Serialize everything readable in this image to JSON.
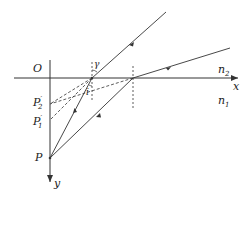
{
  "diagram": {
    "type": "refraction-ray-diagram",
    "labels": {
      "origin": "O",
      "x_axis": "x",
      "y_axis": "y",
      "medium_upper": "n",
      "medium_upper_sub": "2",
      "medium_lower": "n",
      "medium_lower_sub": "1",
      "object_point": "P",
      "image_1": "P",
      "image_1_sup": "′",
      "image_1_sub": "1",
      "image_2": "P",
      "image_2_sup": "′",
      "image_2_sub": "2",
      "refraction_angle": "γ",
      "incidence_angle": "i"
    },
    "colors": {
      "line": "#333333",
      "background": "#ffffff"
    }
  }
}
